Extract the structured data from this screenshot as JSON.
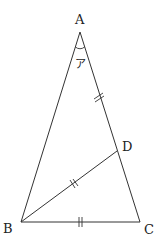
{
  "diagram": {
    "type": "geometry-triangle",
    "colors": {
      "line": "#333333",
      "text": "#222222",
      "background": "#ffffff"
    },
    "points": {
      "A": {
        "label": "A",
        "x": 80,
        "y": 32
      },
      "B": {
        "label": "B",
        "x": 21,
        "y": 222
      },
      "C": {
        "label": "C",
        "x": 140,
        "y": 222
      },
      "D": {
        "label": "D",
        "x": 117,
        "y": 151
      }
    },
    "segments": [
      {
        "from": "A",
        "to": "B"
      },
      {
        "from": "A",
        "to": "C"
      },
      {
        "from": "B",
        "to": "C"
      },
      {
        "from": "B",
        "to": "D"
      }
    ],
    "equal_marks": [
      {
        "segment": "AD",
        "mark": "double-tick"
      },
      {
        "segment": "BD",
        "mark": "double-tick"
      },
      {
        "segment": "BC",
        "mark": "double-tick"
      }
    ],
    "angle": {
      "vertex": "A",
      "label": "ア"
    }
  }
}
